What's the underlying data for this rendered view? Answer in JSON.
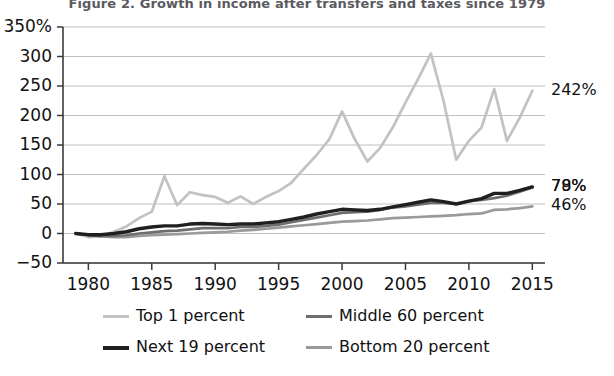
{
  "chart_data": {
    "type": "line",
    "title": "Figure 2. Growth in income after transfers and taxes since 1979",
    "xlabel": "",
    "ylabel": "",
    "xlim": [
      1978,
      2016
    ],
    "ylim": [
      -50,
      350
    ],
    "grid": true,
    "legend_position": "bottom",
    "x_ticks": [
      "1980",
      "1985",
      "1990",
      "1995",
      "2000",
      "2005",
      "2010",
      "2015"
    ],
    "x_tick_values": [
      1980,
      1985,
      1990,
      1995,
      2000,
      2005,
      2010,
      2015
    ],
    "y_ticks": [
      "350%",
      "300",
      "250",
      "200",
      "150",
      "100",
      "50",
      "0",
      "-50"
    ],
    "y_tick_values": [
      350,
      300,
      250,
      200,
      150,
      100,
      50,
      0,
      -50
    ],
    "x": [
      1979,
      1980,
      1981,
      1982,
      1983,
      1984,
      1985,
      1986,
      1987,
      1988,
      1989,
      1990,
      1991,
      1992,
      1993,
      1994,
      1995,
      1996,
      1997,
      1998,
      1999,
      2000,
      2001,
      2002,
      2003,
      2004,
      2005,
      2006,
      2007,
      2008,
      2009,
      2010,
      2011,
      2012,
      2013,
      2014,
      2015
    ],
    "series": [
      {
        "name": "Top 1 percent",
        "color": "#c2c2c2",
        "end_label": "242%",
        "end_value": 242,
        "values": [
          0,
          -6,
          -5,
          3,
          12,
          26,
          37,
          97,
          48,
          70,
          65,
          62,
          52,
          63,
          50,
          62,
          72,
          86,
          110,
          133,
          160,
          207,
          160,
          122,
          145,
          180,
          222,
          262,
          305,
          225,
          125,
          157,
          180,
          245,
          157,
          196,
          242
        ]
      },
      {
        "name": "Next 19 percent",
        "color": "#1f1f1f",
        "end_label": "79%",
        "end_value": 79,
        "values": [
          0,
          -2,
          -2,
          0,
          3,
          8,
          11,
          13,
          13,
          16,
          17,
          16,
          15,
          16,
          16,
          18,
          20,
          24,
          28,
          33,
          37,
          41,
          40,
          39,
          41,
          45,
          49,
          53,
          57,
          54,
          50,
          55,
          59,
          68,
          68,
          73,
          79
        ]
      },
      {
        "name": "Middle 60 percent",
        "color": "#6e6e6e",
        "end_label": "78%",
        "end_value": 78,
        "values": [
          0,
          -3,
          -4,
          -4,
          -3,
          0,
          2,
          4,
          5,
          7,
          9,
          9,
          9,
          11,
          11,
          13,
          15,
          19,
          23,
          27,
          31,
          35,
          36,
          37,
          40,
          44,
          46,
          49,
          52,
          52,
          50,
          55,
          57,
          60,
          64,
          71,
          78
        ]
      },
      {
        "name": "Bottom 20 percent",
        "color": "#9a9a9a",
        "end_label": "46%",
        "end_value": 46,
        "values": [
          0,
          -3,
          -5,
          -6,
          -6,
          -4,
          -3,
          -2,
          -1,
          0,
          1,
          2,
          3,
          5,
          6,
          8,
          10,
          12,
          14,
          16,
          18,
          20,
          21,
          22,
          24,
          26,
          27,
          28,
          29,
          30,
          31,
          33,
          34,
          40,
          41,
          43,
          46
        ]
      }
    ]
  },
  "legend": {
    "items": [
      {
        "label": "Top 1 percent"
      },
      {
        "label": "Middle 60 percent"
      },
      {
        "label": "Next 19 percent"
      },
      {
        "label": "Bottom 20 percent"
      }
    ]
  }
}
